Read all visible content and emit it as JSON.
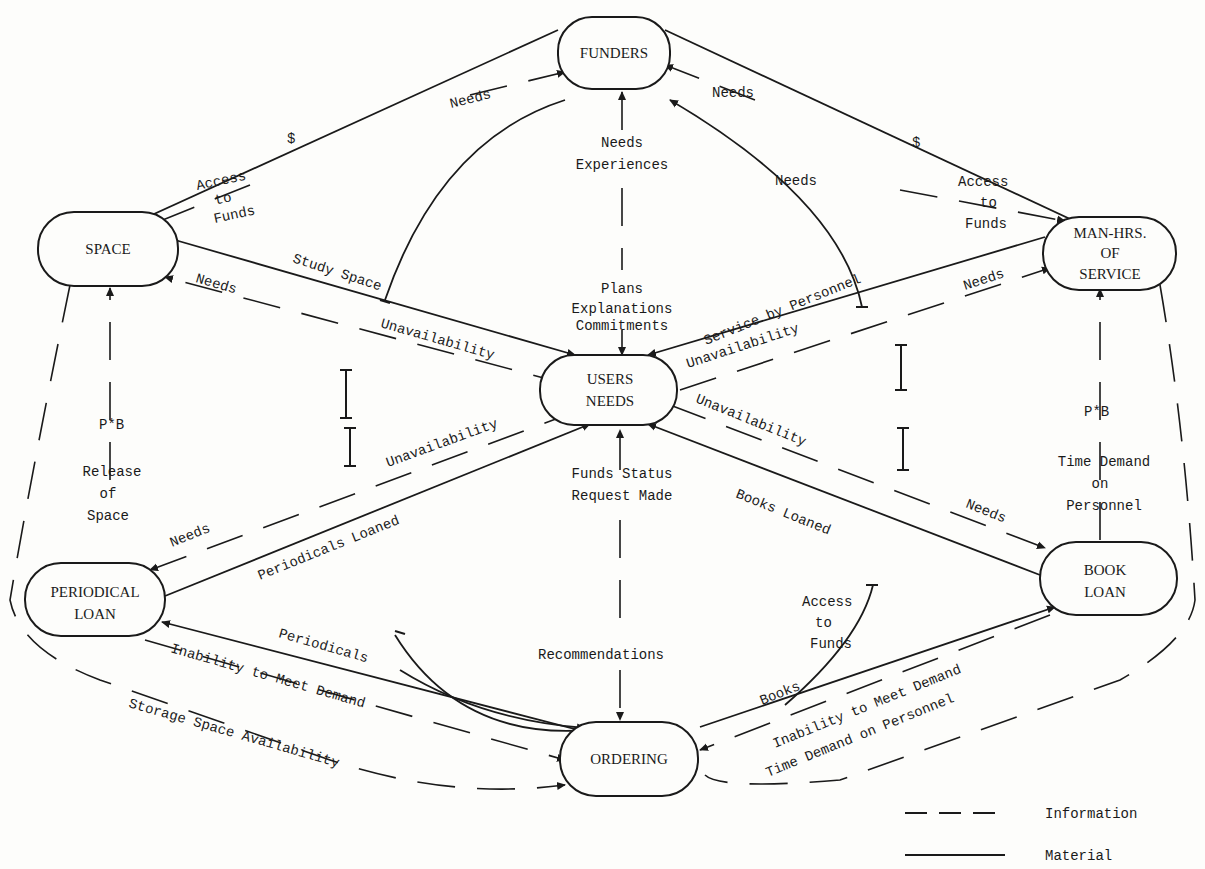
{
  "nodes": {
    "funders": {
      "lines": [
        "FUNDERS"
      ]
    },
    "space": {
      "lines": [
        "SPACE"
      ]
    },
    "manhrs": {
      "lines": [
        "MAN-HRS.",
        "OF",
        "SERVICE"
      ]
    },
    "users": {
      "lines": [
        "USERS",
        "NEEDS"
      ]
    },
    "periodical": {
      "lines": [
        "PERIODICAL",
        "LOAN"
      ]
    },
    "bookloan": {
      "lines": [
        "BOOK",
        "LOAN"
      ]
    },
    "ordering": {
      "lines": [
        "ORDERING"
      ]
    }
  },
  "labels": {
    "dollar_left": "$",
    "dollar_right": "$",
    "needs_funders_left": "Needs",
    "needs_funders_right": "Needs",
    "access_funds_left": [
      "Access",
      "to",
      "Funds"
    ],
    "access_funds_right": [
      "Access",
      "to",
      "Funds"
    ],
    "needs_experiences": [
      "Needs",
      "Experiences"
    ],
    "needs_mid_right": "Needs",
    "study_space": "Study Space",
    "needs_space": "Needs",
    "unavail_space": "Unavailability",
    "plans": [
      "Plans",
      "Explanations",
      "Commitments"
    ],
    "service_by_personnel": "Service by Personnel",
    "unavail_manhrs": "Unavailability",
    "needs_manhrs": "Needs",
    "pb_left": "P*B",
    "release_space": [
      "Release",
      "of",
      "Space"
    ],
    "pb_right": "P*B",
    "time_demand_personnel": [
      "Time Demand",
      "on",
      "Personnel"
    ],
    "unavail_periodical": "Unavailability",
    "unavail_book": "Unavailability",
    "funds_status": [
      "Funds Status",
      "Request Made"
    ],
    "needs_periodical": "Needs",
    "periodicals_loaned": "Periodicals Loaned",
    "books_loaned": "Books Loaned",
    "needs_book": "Needs",
    "access_funds_bottom": [
      "Access",
      "to",
      "Funds"
    ],
    "recommendations": "Recommendations",
    "periodicals": "Periodicals",
    "inability_left": "Inability to Meet Demand",
    "storage_space": "Storage Space Availability",
    "books": "Books",
    "inability_right": "Inability to Meet Demand",
    "time_demand_bottom": "Time Demand on Personnel"
  },
  "legend": {
    "information": "Information",
    "material": "Material"
  }
}
